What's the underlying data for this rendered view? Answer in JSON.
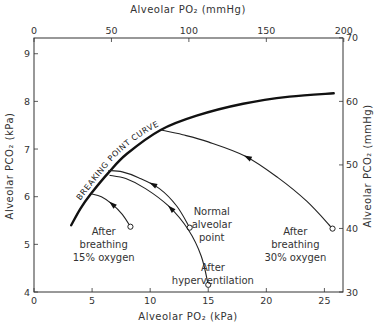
{
  "chart_data": {
    "type": "line",
    "title": "",
    "xlabel_bottom": "Alveolar PO₂ (kPa)",
    "xlabel_top": "Alveolar PO₂ (mmHg)",
    "ylabel_left": "Alveolar PCO₂ (kPa)",
    "ylabel_right": "Alveolar PCO₂ (mmHg)",
    "xlim_kpa": [
      0,
      26.6
    ],
    "ylim_kpa": [
      4,
      9.33
    ],
    "x_ticks_bottom": [
      0,
      5,
      10,
      15,
      20,
      25
    ],
    "x_ticks_top_mmhg": [
      0,
      50,
      100,
      150,
      200
    ],
    "y_ticks_left": [
      4,
      5,
      6,
      7,
      8,
      9
    ],
    "y_ticks_right_mmhg": [
      30,
      40,
      50,
      60,
      70
    ],
    "grid": false,
    "series": [
      {
        "name": "Breaking point curve",
        "label": "BREAKING POINT CURVE",
        "style": "thick",
        "points": [
          [
            3.2,
            5.4
          ],
          [
            4.0,
            5.75
          ],
          [
            4.9,
            6.06
          ],
          [
            6.4,
            6.5
          ],
          [
            8.0,
            6.9
          ],
          [
            10.9,
            7.4
          ],
          [
            14.0,
            7.7
          ],
          [
            18.0,
            7.95
          ],
          [
            22.0,
            8.1
          ],
          [
            25.8,
            8.17
          ]
        ]
      },
      {
        "name": "After breathing 15% oxygen",
        "start": [
          8.3,
          5.37
        ],
        "end": [
          4.9,
          6.06
        ],
        "points": [
          [
            8.3,
            5.37
          ],
          [
            7.6,
            5.63
          ],
          [
            6.7,
            5.85
          ],
          [
            5.8,
            6.0
          ],
          [
            4.9,
            6.06
          ]
        ]
      },
      {
        "name": "Normal alveolar point",
        "start": [
          13.4,
          5.35
        ],
        "end": [
          6.4,
          6.55
        ],
        "points": [
          [
            13.4,
            5.35
          ],
          [
            12.3,
            5.8
          ],
          [
            10.8,
            6.17
          ],
          [
            9.0,
            6.4
          ],
          [
            7.6,
            6.52
          ],
          [
            6.4,
            6.55
          ]
        ]
      },
      {
        "name": "After hyperventilation",
        "start": [
          15.0,
          4.15
        ],
        "end": [
          6.5,
          6.45
        ],
        "points": [
          [
            15.0,
            4.15
          ],
          [
            14.4,
            4.75
          ],
          [
            13.3,
            5.3
          ],
          [
            11.6,
            5.8
          ],
          [
            9.6,
            6.17
          ],
          [
            7.9,
            6.38
          ],
          [
            6.5,
            6.45
          ]
        ]
      },
      {
        "name": "After breathing 30% oxygen",
        "start": [
          25.7,
          5.33
        ],
        "end": [
          10.9,
          7.4
        ],
        "points": [
          [
            25.7,
            5.33
          ],
          [
            23.5,
            5.9
          ],
          [
            21.0,
            6.4
          ],
          [
            18.2,
            6.85
          ],
          [
            15.0,
            7.15
          ],
          [
            12.8,
            7.3
          ],
          [
            10.9,
            7.4
          ]
        ]
      }
    ],
    "annotations": [
      {
        "lines": [
          "After",
          "breathing",
          "15% oxygen"
        ],
        "x": 6.0,
        "y": 5.2
      },
      {
        "lines": [
          "Normal",
          "alveolar",
          "point"
        ],
        "x": 15.3,
        "y": 5.62
      },
      {
        "lines": [
          "After",
          "hyperventilation"
        ],
        "x": 15.4,
        "y": 4.45
      },
      {
        "lines": [
          "After",
          "breathing",
          "30% oxygen"
        ],
        "x": 22.5,
        "y": 5.2
      }
    ]
  },
  "labels": {
    "top_axis_title": "Alveolar PO₂ (mmHg)",
    "bottom_axis_title": "Alveolar PO₂ (kPa)",
    "left_axis_title": "Alveolar PCO₂ (kPa)",
    "right_axis_title": "Alveolar PCO₂ (mmHg)",
    "curve_label": "BREAKING POINT CURVE"
  }
}
